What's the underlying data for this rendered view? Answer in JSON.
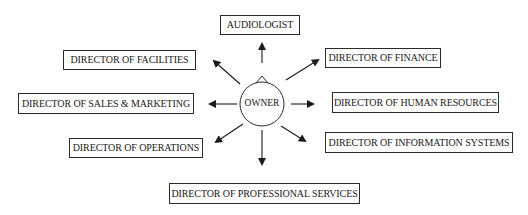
{
  "diagram": {
    "center": {
      "label": "OWNER"
    },
    "nodes": [
      {
        "id": "audiologist",
        "label": "AUDIOLOGIST",
        "x": 220,
        "y": 15,
        "w": 80,
        "h": 20
      },
      {
        "id": "facilities",
        "label": "DIRECTOR OF FACILITIES",
        "x": 63,
        "y": 50,
        "w": 133,
        "h": 20
      },
      {
        "id": "finance",
        "label": "DIRECTOR OF FINANCE",
        "x": 325,
        "y": 48,
        "w": 116,
        "h": 20
      },
      {
        "id": "sales",
        "label": "DIRECTOR OF SALES & MARKETING",
        "x": 18,
        "y": 93,
        "w": 176,
        "h": 21
      },
      {
        "id": "hr",
        "label": "DIRECTOR OF HUMAN RESOURCES",
        "x": 332,
        "y": 92,
        "w": 167,
        "h": 21
      },
      {
        "id": "operations",
        "label": "DIRECTOR OF OPERATIONS",
        "x": 69,
        "y": 138,
        "w": 134,
        "h": 20
      },
      {
        "id": "infosys",
        "label": "DIRECTOR OF INFORMATION SYSTEMS",
        "x": 325,
        "y": 132,
        "w": 188,
        "h": 21
      },
      {
        "id": "professional",
        "label": "DIRECTOR OF PROFESSIONAL SERVICES",
        "x": 169,
        "y": 183,
        "w": 191,
        "h": 21
      }
    ],
    "colors": {
      "stroke": "#1a1a1a",
      "background": "#ffffff"
    }
  }
}
